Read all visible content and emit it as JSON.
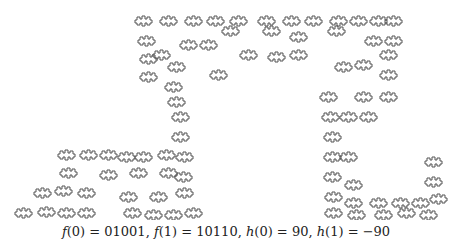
{
  "figure": {
    "type": "fractal-curve",
    "stroke_color": "#555555",
    "background": "#ffffff",
    "tiles": [
      [
        135,
        14
      ],
      [
        160,
        14
      ],
      [
        185,
        14
      ],
      [
        207,
        14
      ],
      [
        230,
        14
      ],
      [
        258,
        14
      ],
      [
        283,
        14
      ],
      [
        305,
        14
      ],
      [
        330,
        14
      ],
      [
        350,
        14
      ],
      [
        370,
        14
      ],
      [
        385,
        14
      ],
      [
        138,
        34
      ],
      [
        180,
        38
      ],
      [
        200,
        38
      ],
      [
        222,
        24
      ],
      [
        263,
        24
      ],
      [
        290,
        30
      ],
      [
        328,
        24
      ],
      [
        365,
        34
      ],
      [
        385,
        34
      ],
      [
        140,
        52
      ],
      [
        153,
        48
      ],
      [
        240,
        48
      ],
      [
        268,
        50
      ],
      [
        290,
        48
      ],
      [
        380,
        48
      ],
      [
        140,
        70
      ],
      [
        165,
        80
      ],
      [
        168,
        60
      ],
      [
        210,
        68
      ],
      [
        380,
        68
      ],
      [
        335,
        60
      ],
      [
        355,
        58
      ],
      [
        168,
        95
      ],
      [
        172,
        110
      ],
      [
        320,
        90
      ],
      [
        355,
        90
      ],
      [
        380,
        90
      ],
      [
        172,
        130
      ],
      [
        322,
        110
      ],
      [
        340,
        110
      ],
      [
        360,
        110
      ],
      [
        58,
        148
      ],
      [
        80,
        148
      ],
      [
        100,
        148
      ],
      [
        118,
        150
      ],
      [
        135,
        150
      ],
      [
        158,
        148
      ],
      [
        176,
        150
      ],
      [
        324,
        130
      ],
      [
        60,
        166
      ],
      [
        100,
        168
      ],
      [
        130,
        166
      ],
      [
        160,
        166
      ],
      [
        175,
        170
      ],
      [
        324,
        150
      ],
      [
        340,
        150
      ],
      [
        425,
        155
      ],
      [
        34,
        186
      ],
      [
        55,
        184
      ],
      [
        78,
        186
      ],
      [
        120,
        190
      ],
      [
        150,
        190
      ],
      [
        176,
        186
      ],
      [
        324,
        170
      ],
      [
        345,
        178
      ],
      [
        425,
        175
      ],
      [
        15,
        206
      ],
      [
        38,
        205
      ],
      [
        58,
        206
      ],
      [
        78,
        206
      ],
      [
        124,
        206
      ],
      [
        145,
        208
      ],
      [
        165,
        208
      ],
      [
        185,
        206
      ],
      [
        325,
        190
      ],
      [
        345,
        196
      ],
      [
        370,
        196
      ],
      [
        392,
        196
      ],
      [
        412,
        196
      ],
      [
        430,
        192
      ],
      [
        325,
        206
      ],
      [
        348,
        208
      ],
      [
        375,
        208
      ],
      [
        398,
        206
      ],
      [
        420,
        208
      ]
    ]
  },
  "caption": {
    "f0_label": "f",
    "f0_arg": "(0) = 01001, ",
    "f1_label": "f",
    "f1_arg": "(1) = 10110, ",
    "h0_label": "h",
    "h0_arg": "(0) = 90, ",
    "h1_label": "h",
    "h1_arg": "(1) = −90"
  }
}
